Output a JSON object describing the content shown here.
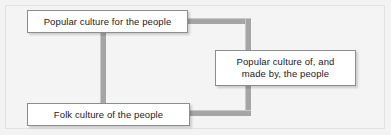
{
  "figure": {
    "type": "flow-diagram",
    "background_color": "#f3f3f3",
    "frame_border_color": "#e2e2e2",
    "connector_color": "#a5a5a5",
    "node_border_color": "#8d8d8d",
    "node_fill_color": "#ffffff",
    "text_color": "#1a1a1a"
  },
  "nodes": [
    {
      "id": "popular-for",
      "label": "Popular culture for the people",
      "position": "top-left"
    },
    {
      "id": "folk-of",
      "label": "Folk culture of the people",
      "position": "bottom-left"
    },
    {
      "id": "popular-of-made-by",
      "label": "Popular culture of, and\nmade by, the people",
      "position": "right-middle"
    }
  ],
  "connectors": [
    {
      "id": "left-vertical",
      "from": "popular-for",
      "to": "folk-of",
      "orientation": "vertical"
    },
    {
      "id": "top-horizontal",
      "from": "popular-for",
      "to": "right-vertical",
      "orientation": "horizontal"
    },
    {
      "id": "right-vertical",
      "from": "top-horizontal",
      "to": "bottom-horizontal",
      "orientation": "vertical"
    },
    {
      "id": "bottom-horizontal",
      "from": "folk-of",
      "to": "right-vertical",
      "orientation": "horizontal"
    },
    {
      "id": "right-stub",
      "from": "right-vertical",
      "to": "popular-of-made-by",
      "orientation": "vertical"
    }
  ]
}
